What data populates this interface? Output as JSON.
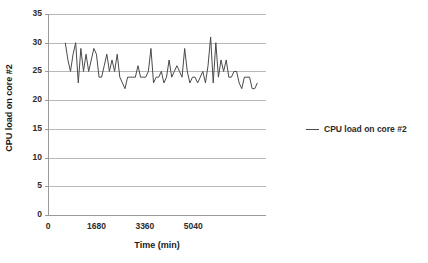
{
  "chart_data": {
    "type": "line",
    "title": "",
    "xlabel": "Time (min)",
    "ylabel": "CPU load on core #2",
    "legend": [
      "CPU load on core #2"
    ],
    "legend_position": "right",
    "grid": true,
    "xlim": [
      0,
      7560
    ],
    "ylim": [
      0,
      35
    ],
    "ytick_labels": [
      "0",
      "5",
      "10",
      "15",
      "20",
      "25",
      "30",
      "35"
    ],
    "ytick_values": [
      0,
      5,
      10,
      15,
      20,
      25,
      30,
      35
    ],
    "xtick_labels": [
      "0",
      "1680",
      "3360",
      "5040"
    ],
    "xtick_values": [
      0,
      1680,
      3360,
      5040
    ],
    "series": [
      {
        "name": "CPU load on core #2",
        "color": "#4a4a4a",
        "x": [
          600,
          690,
          780,
          870,
          960,
          1050,
          1140,
          1230,
          1320,
          1410,
          1500,
          1590,
          1680,
          1770,
          1860,
          1950,
          2040,
          2130,
          2220,
          2310,
          2400,
          2490,
          2580,
          2670,
          2760,
          2850,
          2940,
          3030,
          3120,
          3210,
          3300,
          3390,
          3480,
          3570,
          3660,
          3750,
          3840,
          3930,
          4020,
          4110,
          4200,
          4290,
          4380,
          4470,
          4560,
          4650,
          4740,
          4830,
          4920,
          5010,
          5100,
          5190,
          5280,
          5370,
          5460,
          5550,
          5640,
          5730,
          5820,
          5910,
          6000,
          6090,
          6180,
          6270,
          6360,
          6450,
          6540,
          6630,
          6720,
          6810,
          6900,
          6990,
          7080,
          7170,
          7260
        ],
        "values": [
          30,
          27,
          25,
          28,
          30,
          23,
          29,
          25,
          28,
          25,
          27,
          29,
          28,
          24,
          24,
          26,
          28,
          25,
          27,
          25,
          28,
          24,
          23,
          22,
          24,
          24,
          24,
          24,
          26,
          24,
          24,
          24,
          25,
          29,
          23,
          24,
          24,
          25,
          23,
          24,
          27,
          24,
          25,
          26,
          25,
          24,
          29,
          25,
          23,
          24,
          24,
          23,
          24,
          25,
          23,
          26,
          31,
          23,
          30,
          24,
          27,
          25,
          27,
          24,
          24,
          25,
          25,
          23,
          22,
          24,
          24,
          24,
          22,
          22,
          23
        ]
      }
    ]
  },
  "axes": {
    "y_title": "CPU load on core #2",
    "x_title": "Time (min)"
  },
  "legend": {
    "entry_label": "CPU load on core #2"
  },
  "colors": {
    "line": "#4a4a4a",
    "grid": "#b8b8b8",
    "axis": "#9a9a9a",
    "text": "#1a1a1a"
  }
}
